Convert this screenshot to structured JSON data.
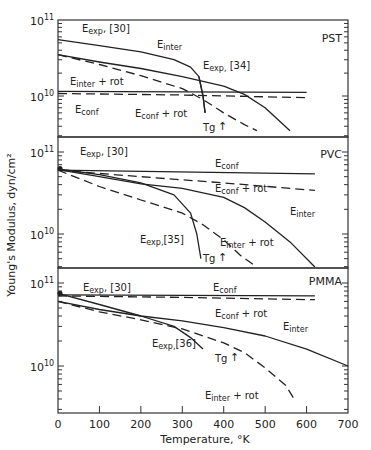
{
  "figure": {
    "ylabel": "Young's Modulus, dyn/cm²",
    "xlabel": "Temperature, °K",
    "x_ticks": [
      "0",
      "100",
      "200",
      "300",
      "400",
      "500",
      "600",
      "700"
    ],
    "panels": [
      {
        "name": "PST",
        "tick_top": "10",
        "tick_top_exp": "11",
        "tick_mid": "10",
        "tick_mid_exp": "10"
      },
      {
        "name": "PVC",
        "tick_top": "10",
        "tick_top_exp": "11",
        "tick_mid": "10",
        "tick_mid_exp": "10"
      },
      {
        "name": "PMMA",
        "tick_top": "10",
        "tick_top_exp": "11",
        "tick_mid": "10",
        "tick_mid_exp": "10"
      }
    ]
  },
  "chart_data": [
    {
      "type": "line",
      "title": "PST",
      "xlabel": "Temperature, °K",
      "ylabel": "Young's Modulus, dyn/cm²",
      "yscale": "log",
      "xlim": [
        0,
        700
      ],
      "ylim": [
        3500000000.0,
        100000000000.0
      ],
      "annotations": [
        "Tg ↑ at ~360 K"
      ],
      "series": [
        {
          "name": "E exp, [30]",
          "style": "solid",
          "x": [
            0,
            100,
            200,
            280,
            320,
            340,
            350,
            355
          ],
          "y": [
            55000000000.0,
            46000000000.0,
            38000000000.0,
            30000000000.0,
            24000000000.0,
            18000000000.0,
            10000000000.0,
            6000000000.0
          ]
        },
        {
          "name": "E exp, [34]",
          "style": "solid",
          "x": [
            340,
            350,
            355
          ],
          "y": [
            18000000000.0,
            10000000000.0,
            6000000000.0
          ]
        },
        {
          "name": "E inter",
          "style": "solid",
          "x": [
            0,
            100,
            200,
            300,
            400,
            450,
            500,
            560
          ],
          "y": [
            35000000000.0,
            28000000000.0,
            23000000000.0,
            18000000000.0,
            13500000000.0,
            10500000000.0,
            7000000000.0,
            3500000000.0
          ]
        },
        {
          "name": "E inter + rot",
          "style": "dashed",
          "x": [
            0,
            100,
            200,
            300,
            350,
            400,
            450,
            480
          ],
          "y": [
            35000000000.0,
            26000000000.0,
            18500000000.0,
            12500000000.0,
            9000000000.0,
            6000000000.0,
            4200000000.0,
            3500000000.0
          ]
        },
        {
          "name": "E conf",
          "style": "solid",
          "x": [
            0,
            600
          ],
          "y": [
            11500000000.0,
            11200000000.0
          ]
        },
        {
          "name": "E conf + rot",
          "style": "dashed",
          "x": [
            0,
            300,
            600
          ],
          "y": [
            10800000000.0,
            10300000000.0,
            9500000000.0
          ]
        }
      ]
    },
    {
      "type": "line",
      "title": "PVC",
      "xlabel": "Temperature, °K",
      "ylabel": "Young's Modulus, dyn/cm²",
      "yscale": "log",
      "xlim": [
        0,
        700
      ],
      "ylim": [
        3500000000.0,
        120000000000.0
      ],
      "annotations": [
        "Tg ↑ at ~350 K"
      ],
      "series": [
        {
          "name": "E exp, [30]",
          "style": "marker",
          "x": [
            0
          ],
          "y": [
            63000000000.0
          ]
        },
        {
          "name": "E conf",
          "style": "solid",
          "x": [
            0,
            620
          ],
          "y": [
            60000000000.0,
            54000000000.0
          ]
        },
        {
          "name": "E conf + rot",
          "style": "dashed",
          "x": [
            0,
            200,
            400,
            620
          ],
          "y": [
            60000000000.0,
            50000000000.0,
            42000000000.0,
            34000000000.0
          ]
        },
        {
          "name": "E inter",
          "style": "solid",
          "x": [
            0,
            100,
            200,
            300,
            400,
            450,
            500,
            560,
            620
          ],
          "y": [
            61000000000.0,
            50000000000.0,
            41000000000.0,
            36000000000.0,
            28000000000.0,
            21000000000.0,
            14000000000.0,
            8000000000.0,
            3600000000.0
          ]
        },
        {
          "name": "E exp, [35]",
          "style": "solid",
          "x": [
            0,
            100,
            200,
            280,
            320,
            335,
            345
          ],
          "y": [
            62000000000.0,
            53000000000.0,
            42000000000.0,
            30000000000.0,
            18000000000.0,
            10000000000.0,
            5000000000.0
          ]
        },
        {
          "name": "E inter + rot",
          "style": "dashed",
          "x": [
            0,
            100,
            200,
            300,
            350,
            400,
            440,
            480
          ],
          "y": [
            60000000000.0,
            38000000000.0,
            26000000000.0,
            18000000000.0,
            13000000000.0,
            8500000000.0,
            5500000000.0,
            3600000000.0
          ]
        }
      ]
    },
    {
      "type": "line",
      "title": "PMMA",
      "xlabel": "Temperature, °K",
      "ylabel": "Young's Modulus, dyn/cm²",
      "yscale": "log",
      "xlim": [
        0,
        700
      ],
      "ylim": [
        3500000000.0,
        120000000000.0
      ],
      "annotations": [
        "Tg ↑ at ~380 K"
      ],
      "series": [
        {
          "name": "E exp, [30]",
          "style": "marker",
          "x": [
            0
          ],
          "y": [
            75000000000.0
          ]
        },
        {
          "name": "E conf",
          "style": "solid",
          "x": [
            0,
            620
          ],
          "y": [
            72000000000.0,
            70000000000.0
          ]
        },
        {
          "name": "E conf + rot",
          "style": "dashed",
          "x": [
            0,
            300,
            620
          ],
          "y": [
            70000000000.0,
            67000000000.0,
            63000000000.0
          ]
        },
        {
          "name": "E inter",
          "style": "solid",
          "x": [
            0,
            100,
            200,
            300,
            400,
            500,
            600,
            700
          ],
          "y": [
            60000000000.0,
            48000000000.0,
            40000000000.0,
            35000000000.0,
            29000000000.0,
            23000000000.0,
            16000000000.0,
            10000000000.0
          ]
        },
        {
          "name": "E exp, [36]",
          "style": "solid",
          "x": [
            0,
            100,
            200,
            280,
            320,
            350
          ],
          "y": [
            75000000000.0,
            55000000000.0,
            40000000000.0,
            30000000000.0,
            22000000000.0,
            16000000000.0
          ]
        },
        {
          "name": "E inter + rot",
          "style": "dashed",
          "x": [
            0,
            100,
            200,
            300,
            400,
            450,
            500,
            550,
            570
          ],
          "y": [
            60000000000.0,
            45000000000.0,
            36000000000.0,
            28000000000.0,
            19000000000.0,
            14500000000.0,
            9500000000.0,
            5800000000.0,
            4000000000.0
          ]
        }
      ]
    }
  ]
}
